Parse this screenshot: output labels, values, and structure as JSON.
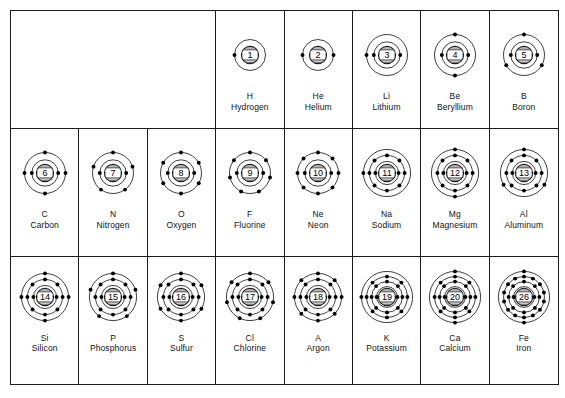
{
  "figure": {
    "background_color": "#ffffff",
    "line_color": "#1d1d1d",
    "electron_color": "#000000",
    "columns": 8,
    "rows": 3
  },
  "empty_cell": {
    "label": "",
    "spans_columns": 3
  },
  "elements": [
    {
      "row": 1,
      "col": 4,
      "z": 1,
      "symbol": "H",
      "name": "Hydrogen",
      "shells": [
        1
      ],
      "shell_count": 1
    },
    {
      "row": 1,
      "col": 5,
      "z": 2,
      "symbol": "He",
      "name": "Helium",
      "shells": [
        2
      ],
      "shell_count": 1
    },
    {
      "row": 1,
      "col": 6,
      "z": 3,
      "symbol": "Li",
      "name": "Lithium",
      "shells": [
        2,
        1
      ],
      "shell_count": 2
    },
    {
      "row": 1,
      "col": 7,
      "z": 4,
      "symbol": "Be",
      "name": "Beryllium",
      "shells": [
        2,
        2
      ],
      "shell_count": 2
    },
    {
      "row": 1,
      "col": 8,
      "z": 5,
      "symbol": "B",
      "name": "Boron",
      "shells": [
        2,
        3
      ],
      "shell_count": 2
    },
    {
      "row": 2,
      "col": 1,
      "z": 6,
      "symbol": "C",
      "name": "Carbon",
      "shells": [
        2,
        4
      ],
      "shell_count": 2
    },
    {
      "row": 2,
      "col": 2,
      "z": 7,
      "symbol": "N",
      "name": "Nitrogen",
      "shells": [
        2,
        5
      ],
      "shell_count": 2
    },
    {
      "row": 2,
      "col": 3,
      "z": 8,
      "symbol": "O",
      "name": "Oxygen",
      "shells": [
        2,
        6
      ],
      "shell_count": 2
    },
    {
      "row": 2,
      "col": 4,
      "z": 9,
      "symbol": "F",
      "name": "Fluorine",
      "shells": [
        2,
        7
      ],
      "shell_count": 2
    },
    {
      "row": 2,
      "col": 5,
      "z": 10,
      "symbol": "Ne",
      "name": "Neon",
      "shells": [
        2,
        8
      ],
      "shell_count": 2
    },
    {
      "row": 2,
      "col": 6,
      "z": 11,
      "symbol": "Na",
      "name": "Sodium",
      "shells": [
        2,
        8,
        1
      ],
      "shell_count": 3
    },
    {
      "row": 2,
      "col": 7,
      "z": 12,
      "symbol": "Mg",
      "name": "Magnesium",
      "shells": [
        2,
        8,
        2
      ],
      "shell_count": 3
    },
    {
      "row": 2,
      "col": 8,
      "z": 13,
      "symbol": "Al",
      "name": "Aluminum",
      "shells": [
        2,
        8,
        3
      ],
      "shell_count": 3
    },
    {
      "row": 3,
      "col": 1,
      "z": 14,
      "symbol": "Si",
      "name": "Silicon",
      "shells": [
        2,
        8,
        4
      ],
      "shell_count": 3
    },
    {
      "row": 3,
      "col": 2,
      "z": 15,
      "symbol": "P",
      "name": "Phosphorus",
      "shells": [
        2,
        8,
        5
      ],
      "shell_count": 3
    },
    {
      "row": 3,
      "col": 3,
      "z": 16,
      "symbol": "S",
      "name": "Sulfur",
      "shells": [
        2,
        8,
        6
      ],
      "shell_count": 3
    },
    {
      "row": 3,
      "col": 4,
      "z": 17,
      "symbol": "Cl",
      "name": "Chlorine",
      "shells": [
        2,
        8,
        7
      ],
      "shell_count": 3
    },
    {
      "row": 3,
      "col": 5,
      "z": 18,
      "symbol": "A",
      "name": "Argon",
      "shells": [
        2,
        8,
        8
      ],
      "shell_count": 3
    },
    {
      "row": 3,
      "col": 6,
      "z": 19,
      "symbol": "K",
      "name": "Potassium",
      "shells": [
        2,
        8,
        8,
        1
      ],
      "shell_count": 4
    },
    {
      "row": 3,
      "col": 7,
      "z": 20,
      "symbol": "Ca",
      "name": "Calcium",
      "shells": [
        2,
        8,
        8,
        2
      ],
      "shell_count": 4
    },
    {
      "row": 3,
      "col": 8,
      "z": 26,
      "symbol": "Fe",
      "name": "Iron",
      "shells": [
        2,
        8,
        14,
        2
      ],
      "shell_count": 4
    }
  ]
}
